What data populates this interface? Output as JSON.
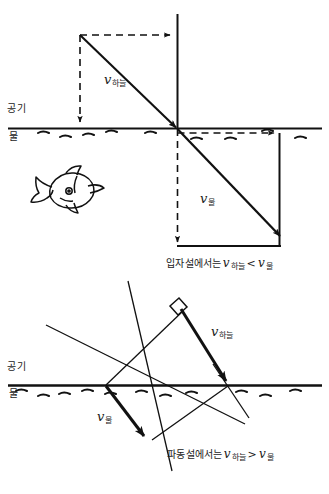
{
  "figure": {
    "ink_color": "#111111",
    "background_color": "#ffffff"
  },
  "diagram_top": {
    "name": "particle-theory-diagram",
    "medium_upper_label": "공기",
    "medium_lower_label": "물",
    "incident_vector_label": {
      "symbol": "v",
      "subscript": "하늘"
    },
    "refracted_vector_label": {
      "symbol": "v",
      "subscript": "물"
    },
    "caption": {
      "text_lead": "입자설에서는",
      "symbol_a": "v",
      "subscript_a": "하늘",
      "relation": "<",
      "symbol_b": "v",
      "subscript_b": "물",
      "full": "입자설에서는 v 하늘 < v 물"
    }
  },
  "diagram_bottom": {
    "name": "wave-theory-diagram",
    "medium_upper_label": "공기",
    "medium_lower_label": "물",
    "incident_vector_label": {
      "symbol": "v",
      "subscript": "하늘"
    },
    "refracted_vector_label": {
      "symbol": "v",
      "subscript": "물"
    },
    "right_angle_marker": "right-angle",
    "caption": {
      "text_lead": "파동설에서는",
      "symbol_a": "v",
      "subscript_a": "하늘",
      "relation": ">",
      "symbol_b": "v",
      "subscript_b": "물",
      "full": "파동설에서는 v 하늘 > v 물"
    }
  },
  "fish": {
    "name": "fish-illustration",
    "description": "hand drawn fish underwater"
  }
}
